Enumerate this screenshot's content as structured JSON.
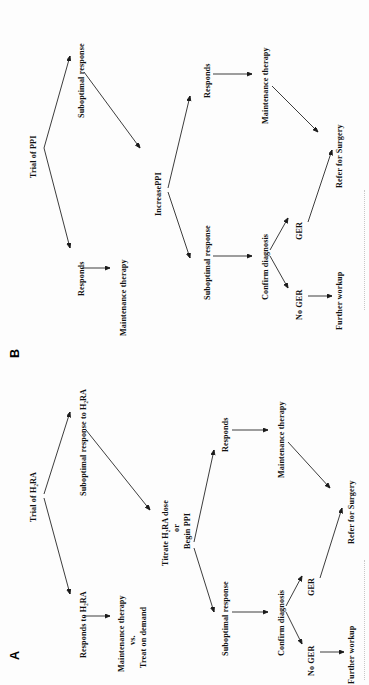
{
  "figure": {
    "orientation": "rotated-90-ccw",
    "background_color": "#fdfdfd",
    "ink_color": "#101010",
    "panel_count": 2
  },
  "panels": [
    {
      "letter": "B",
      "title_node": "Trial of PPI",
      "nodes": {
        "root": "Trial of PPI",
        "branch_suboptimal": "Suboptimal response",
        "branch_responds": "Responds",
        "responds_outcome": "Maintenance therapy",
        "escalation": "IncreasePPI",
        "escalation_responds": "Responds",
        "escalation_responds_outcome": "Maintenance therapy",
        "escalation_suboptimal": "Suboptimal response",
        "confirm": "Confirm diagnosis",
        "ger_yes": "GER",
        "ger_no": "No GER",
        "surgery": "Refer for Surgery",
        "workup": "Further workup"
      }
    },
    {
      "letter": "A",
      "title_node": "Trial of H₂RA",
      "nodes": {
        "root": "Trial of H₂RA",
        "branch_suboptimal": "Suboptimal response to H₂RA",
        "branch_responds": "Responds to H₂RA",
        "responds_outcome_line1": "Maintenance therapy",
        "responds_outcome_line2": "vs.",
        "responds_outcome_line3": "Treat on demand",
        "escalation_line1": "Titrate H₂RA dose",
        "escalation_line2": "or",
        "escalation_line3": "Begin PPI",
        "escalation_responds": "Responds",
        "escalation_responds_outcome": "Maintenance therapy",
        "escalation_suboptimal": "Suboptimal response",
        "confirm": "Confirm diagnosis",
        "ger_yes": "GER",
        "ger_no": "No GER",
        "surgery": "Refer for Surgery",
        "workup": "Further workup"
      }
    }
  ]
}
